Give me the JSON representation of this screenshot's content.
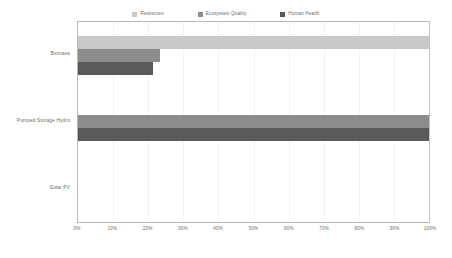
{
  "chart_data": {
    "type": "bar",
    "orientation": "horizontal",
    "title": "",
    "xlabel": "",
    "ylabel": "",
    "categories": [
      "Biomass",
      "Pumped Storage Hydro",
      "Solar PV"
    ],
    "series": [
      {
        "name": "Resources",
        "color": "#c9c9c9",
        "values": [
          100,
          0,
          0
        ]
      },
      {
        "name": "Ecosystem Quality",
        "color": "#8c8c8c",
        "values": [
          23.5,
          100,
          0
        ]
      },
      {
        "name": "Human Health",
        "color": "#595959",
        "values": [
          21.5,
          100,
          0
        ]
      }
    ],
    "xlim": [
      0,
      100
    ],
    "xticks": [
      0,
      10,
      20,
      30,
      40,
      50,
      60,
      70,
      80,
      90,
      100
    ],
    "xtick_labels": [
      "0%",
      "10%",
      "20%",
      "30%",
      "40%",
      "50%",
      "60%",
      "70%",
      "80%",
      "90%",
      "100%"
    ],
    "grid": true,
    "grid_axis": "x",
    "legend_position": "top-center",
    "legend_marker": "square",
    "axis_color": "#b8b8b8",
    "gridline_color": "#f2f2f2",
    "text_color": "#6b6b6b",
    "background": "#ffffff"
  }
}
